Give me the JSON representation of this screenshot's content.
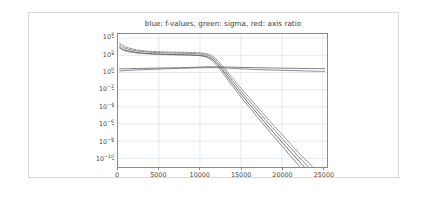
{
  "figure": {
    "title": "blue: f-values, green: sigma, red: axis ratio",
    "background_color": "#ffffff",
    "frame_color": "#d8d8d8",
    "axis_color": "#8a8a8a",
    "grid_color": "#c9d4e2"
  },
  "chart_data": {
    "type": "line",
    "title": "blue: f-values, green: sigma, red: axis ratio",
    "xlabel": "",
    "ylabel": "",
    "yscale": "log",
    "xscale": "linear",
    "xlim": [
      0,
      25500
    ],
    "ylim": [
      1e-11,
      30000
    ],
    "grid": true,
    "legend_position": "none",
    "xticks": [
      0,
      5000,
      10000,
      15000,
      20000,
      25000
    ],
    "xticklabels": [
      "0",
      "5000",
      "10000",
      "15000",
      "20000",
      "25000"
    ],
    "yticks": [
      10000,
      100,
      1,
      0.01,
      0.0001,
      1e-06,
      1e-08,
      1e-10
    ],
    "yticklabels": [
      "10⁴",
      "10²",
      "10⁰",
      "10⁻²",
      "10⁻⁴",
      "10⁻⁶",
      "10⁻⁸",
      "10⁻¹⁰"
    ],
    "ytick_exponents": [
      4,
      2,
      0,
      -2,
      -4,
      -6,
      -8,
      -10
    ],
    "series": [
      {
        "name": "f-value (best)",
        "color": "#4a4a4a",
        "style": "solid",
        "width": 0.8,
        "x": [
          200,
          800,
          1600,
          2500,
          3600,
          4800,
          6000,
          7200,
          8400,
          9600,
          10600,
          11400,
          12200,
          13000,
          14000,
          15200,
          16400,
          17600,
          18800,
          20000,
          21200,
          22400,
          23600,
          24600,
          25200
        ],
        "y": [
          900,
          420,
          280,
          200,
          165,
          140,
          125,
          118,
          112,
          100,
          80,
          40,
          8,
          0.9,
          0.05,
          0.0018,
          8e-05,
          3.5e-06,
          1.6e-07,
          8e-09,
          4e-10,
          2.2e-11,
          1.4e-12,
          1.3e-13,
          5e-14
        ]
      },
      {
        "name": "f-value (median)",
        "color": "#5a5a5a",
        "style": "dashed",
        "width": 0.8,
        "x": [
          200,
          800,
          1600,
          2500,
          3600,
          4800,
          6000,
          7200,
          8400,
          9600,
          10600,
          11400,
          12200,
          13000,
          14000,
          15200,
          16400,
          17600,
          18800,
          20000,
          21200,
          22400,
          23600,
          24600,
          25200
        ],
        "y": [
          1600,
          700,
          420,
          300,
          240,
          205,
          185,
          175,
          168,
          150,
          120,
          62,
          13,
          1.6,
          0.1,
          0.004,
          0.00019,
          8.8e-06,
          4.2e-07,
          2.2e-08,
          1.2e-09,
          6.8e-11,
          4.5e-12,
          4.2e-13,
          1.8e-13
        ]
      },
      {
        "name": "f-value (worst)",
        "color": "#6a6a6a",
        "style": "dashed",
        "width": 0.8,
        "x": [
          200,
          800,
          1600,
          2500,
          3600,
          4800,
          6000,
          7200,
          8400,
          9600,
          10600,
          11400,
          12200,
          13000,
          14000,
          15200,
          16400,
          17600,
          18800,
          20000,
          21200,
          22400,
          23600,
          24600,
          25200
        ],
        "y": [
          2600,
          1100,
          600,
          400,
          310,
          265,
          240,
          228,
          220,
          200,
          165,
          92,
          22,
          2.9,
          0.2,
          0.009,
          0.00045,
          2.2e-05,
          1.1e-06,
          6e-08,
          3.4e-09,
          2e-10,
          1.38e-11,
          1.3e-12,
          5.8e-13
        ]
      },
      {
        "name": "sigma",
        "color": "#707070",
        "style": "solid",
        "width": 0.8,
        "x": [
          200,
          800,
          1600,
          2500,
          3600,
          4800,
          6000,
          7200,
          8400,
          9600,
          10600,
          11400,
          12200,
          13000,
          14000,
          15200,
          16400,
          17600,
          18800,
          20000,
          21200,
          22400,
          23600,
          24600,
          25200
        ],
        "y": [
          700,
          340,
          230,
          175,
          148,
          130,
          120,
          114,
          110,
          98,
          70,
          28,
          4.5,
          0.45,
          0.024,
          0.0008,
          3.4e-05,
          1.4e-06,
          6e-08,
          2.8e-09,
          1.3e-10,
          6.5e-12,
          3.6e-13,
          3.2e-14,
          1.2e-14
        ]
      },
      {
        "name": "axis ratio",
        "color": "#5f5f5f",
        "style": "solid",
        "width": 0.8,
        "x": [
          200,
          1500,
          3000,
          4500,
          6000,
          7500,
          9000,
          10200,
          11000,
          12000,
          13500,
          15000,
          17000,
          19000,
          21000,
          23000,
          25200
        ],
        "y": [
          2.6,
          2.8,
          3.0,
          3.2,
          3.4,
          3.6,
          3.9,
          4.3,
          4.6,
          4.5,
          4.2,
          3.9,
          3.6,
          3.3,
          3.1,
          2.9,
          2.8
        ]
      },
      {
        "name": "condition number",
        "color": "#6d6d6d",
        "style": "solid",
        "width": 0.8,
        "x": [
          200,
          1500,
          3000,
          4500,
          6000,
          7500,
          9000,
          10500,
          12000,
          13500,
          15000,
          17000,
          19000,
          21000,
          23000,
          25200
        ],
        "y": [
          1.5,
          1.8,
          2.1,
          2.4,
          2.7,
          3.0,
          3.3,
          3.6,
          3.7,
          3.2,
          2.7,
          2.2,
          1.9,
          1.7,
          1.5,
          1.35
        ]
      }
    ]
  }
}
